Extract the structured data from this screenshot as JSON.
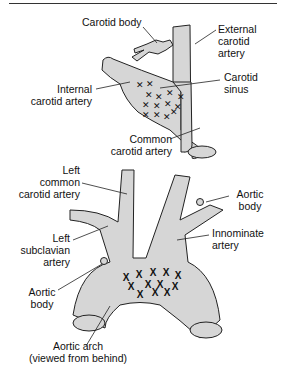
{
  "figure": {
    "top_diagram": {
      "name": "Carotid bifurcation",
      "labels": {
        "carotid_body": "Carotid body",
        "external_carotid": [
          "External",
          "carotid",
          "artery"
        ],
        "internal_carotid": [
          "Internal",
          "carotid artery"
        ],
        "carotid_sinus": [
          "Carotid",
          "sinus"
        ],
        "common_carotid": [
          "Common",
          "carotid artery"
        ]
      },
      "receptor_marker": "×",
      "receptor_count": 14
    },
    "bottom_diagram": {
      "name": "Aortic arch",
      "labels": {
        "left_common_carotid": [
          "Left",
          "common",
          "carotid artery"
        ],
        "aortic_body_right": [
          "Aortic",
          "body"
        ],
        "left_subclavian": [
          "Left",
          "subclavian",
          "artery"
        ],
        "innominate": [
          "Innominate",
          "artery"
        ],
        "aortic_body_left": [
          "Aortic",
          "body"
        ],
        "aortic_arch": [
          "Aortic arch",
          "(viewed from behind)"
        ]
      },
      "receptor_marker": "X",
      "receptor_count": 12
    },
    "colors": {
      "vessel_fill": "#d6d6d6",
      "outline": "#222222",
      "text": "#111111"
    }
  }
}
